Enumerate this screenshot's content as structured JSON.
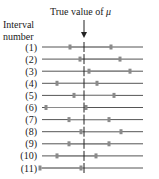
{
  "title": {
    "text": "True value of ",
    "symbol": "μ"
  },
  "axis_label": {
    "line1": "Interval",
    "line2": "number"
  },
  "colors": {
    "line": "#555555",
    "marker": "#8a8a8a",
    "true_value": "#222222"
  },
  "chart_data": {
    "type": "interval",
    "title": "True value of μ",
    "ylabel": "Interval number",
    "true_value_x": 84,
    "intervals": [
      {
        "label": "(1)",
        "lower": 70,
        "upper": 111
      },
      {
        "label": "(2)",
        "lower": 80,
        "upper": 120
      },
      {
        "label": "(3)",
        "lower": 89,
        "upper": 130
      },
      {
        "label": "(4)",
        "lower": 57,
        "upper": 97
      },
      {
        "label": "(5)",
        "lower": 74,
        "upper": 114
      },
      {
        "label": "(6)",
        "lower": 46,
        "upper": 86
      },
      {
        "label": "(7)",
        "lower": 69,
        "upper": 109
      },
      {
        "label": "(8)",
        "lower": 81,
        "upper": 121
      },
      {
        "label": "(9)",
        "lower": 69,
        "upper": 109
      },
      {
        "label": "(10)",
        "lower": 57,
        "upper": 96
      },
      {
        "label": "(11)",
        "lower": 40,
        "upper": 81
      }
    ]
  }
}
